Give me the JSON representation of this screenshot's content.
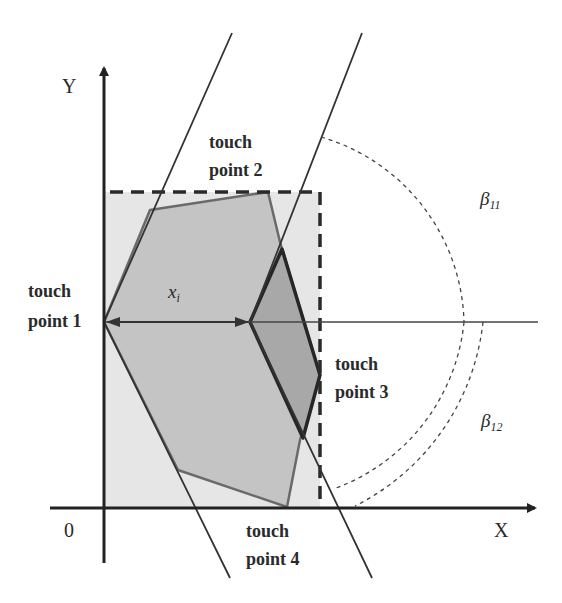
{
  "diagram": {
    "axes": {
      "x_label": "X",
      "y_label": "Y",
      "origin_label": "0"
    },
    "labels": {
      "touch_point_1": {
        "line1": "touch",
        "line2": "point 1"
      },
      "touch_point_2": {
        "line1": "touch",
        "line2": "point 2"
      },
      "touch_point_3": {
        "line1": "touch",
        "line2": "point 3"
      },
      "touch_point_4": {
        "line1": "touch",
        "line2": "point 4"
      },
      "distance": {
        "symbol": "x",
        "subscript": "i"
      },
      "angle_upper": {
        "symbol": "β",
        "subscript": "11"
      },
      "angle_lower": {
        "symbol": "β",
        "subscript": "12"
      }
    },
    "colors": {
      "background": "#ffffff",
      "bounding_box_fill": "#e6e6e6",
      "outer_polygon_fill": "#c4c4c4",
      "inner_polygon_fill": "#a8a8a8",
      "line": "#333333",
      "outline": "#6a6a6a"
    }
  }
}
